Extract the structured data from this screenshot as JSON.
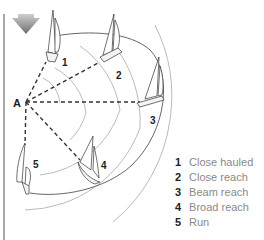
{
  "diagram": {
    "wind_icon": "wind-arrow-icon",
    "origin_label": "A",
    "boats": [
      {
        "number": "1",
        "label": "Close hauled"
      },
      {
        "number": "2",
        "label": "Close reach"
      },
      {
        "number": "3",
        "label": "Beam reach"
      },
      {
        "number": "4",
        "label": "Broad reach"
      },
      {
        "number": "5",
        "label": "Run"
      }
    ],
    "colors": {
      "line": "#333333",
      "arc": "#9a9a9a",
      "arrow_dark": "#777777",
      "arrow_light": "#bbbbbb",
      "legend_text": "#8a8a8a"
    }
  }
}
